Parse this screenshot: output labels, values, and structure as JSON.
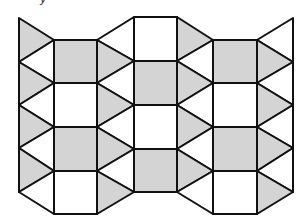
{
  "caption_fragment": "y",
  "colors": {
    "gray": "#d4d4d4",
    "white": "#ffffff",
    "stroke": "#111111"
  },
  "stroke_width": 2,
  "polygons": [
    {
      "pts": "19,18 54,40 19,62",
      "fill": "gray"
    },
    {
      "pts": "19,62 54,40 54,83",
      "fill": "white"
    },
    {
      "pts": "19,62 54,83 19,105",
      "fill": "gray"
    },
    {
      "pts": "19,105 54,83 54,127",
      "fill": "white"
    },
    {
      "pts": "19,105 54,127 19,148",
      "fill": "gray"
    },
    {
      "pts": "19,148 54,127 54,171",
      "fill": "white"
    },
    {
      "pts": "19,148 54,171 19,192",
      "fill": "gray"
    },
    {
      "pts": "19,192 54,171 54,214",
      "fill": "white"
    },
    {
      "pts": "54,40 97,40 97,83 54,83",
      "fill": "gray"
    },
    {
      "pts": "54,83 97,83 97,127 54,127",
      "fill": "white"
    },
    {
      "pts": "54,127 97,127 97,171 54,171",
      "fill": "gray"
    },
    {
      "pts": "54,171 97,171 97,214 54,214",
      "fill": "white"
    },
    {
      "pts": "97,40 134,17 134,61",
      "fill": "white"
    },
    {
      "pts": "97,40 134,61 97,83",
      "fill": "gray"
    },
    {
      "pts": "97,83 134,61 134,105",
      "fill": "white"
    },
    {
      "pts": "97,83 134,105 97,127",
      "fill": "gray"
    },
    {
      "pts": "97,127 134,105 134,149",
      "fill": "white"
    },
    {
      "pts": "97,127 134,149 97,171",
      "fill": "gray"
    },
    {
      "pts": "97,171 134,149 134,192",
      "fill": "white"
    },
    {
      "pts": "97,171 134,192 97,214",
      "fill": "gray"
    },
    {
      "pts": "134,17 177,17 177,61 134,61",
      "fill": "white"
    },
    {
      "pts": "134,61 177,61 177,105 134,105",
      "fill": "gray"
    },
    {
      "pts": "134,105 177,105 177,149 134,149",
      "fill": "white"
    },
    {
      "pts": "134,149 177,149 177,192 134,192",
      "fill": "gray"
    },
    {
      "pts": "177,17 213,40 177,61",
      "fill": "gray"
    },
    {
      "pts": "177,61 213,40 213,83",
      "fill": "white"
    },
    {
      "pts": "177,61 213,83 177,105",
      "fill": "gray"
    },
    {
      "pts": "177,105 213,83 213,127",
      "fill": "white"
    },
    {
      "pts": "177,105 213,127 177,149",
      "fill": "gray"
    },
    {
      "pts": "177,149 213,127 213,171",
      "fill": "white"
    },
    {
      "pts": "177,149 213,171 177,192",
      "fill": "gray"
    },
    {
      "pts": "177,192 213,171 213,214",
      "fill": "white"
    },
    {
      "pts": "213,40 257,40 257,83 213,83",
      "fill": "gray"
    },
    {
      "pts": "213,83 257,83 257,127 213,127",
      "fill": "white"
    },
    {
      "pts": "213,127 257,127 257,171 213,171",
      "fill": "gray"
    },
    {
      "pts": "213,171 257,171 257,214 213,214",
      "fill": "white"
    },
    {
      "pts": "257,40 293,18 293,62",
      "fill": "white"
    },
    {
      "pts": "257,40 293,62 257,83",
      "fill": "gray"
    },
    {
      "pts": "257,83 293,62 293,105",
      "fill": "white"
    },
    {
      "pts": "257,83 293,105 257,127",
      "fill": "gray"
    },
    {
      "pts": "257,127 293,105 293,148",
      "fill": "white"
    },
    {
      "pts": "257,127 293,148 257,171",
      "fill": "gray"
    },
    {
      "pts": "257,171 293,148 293,192",
      "fill": "white"
    },
    {
      "pts": "257,171 293,192 257,214",
      "fill": "gray"
    }
  ]
}
